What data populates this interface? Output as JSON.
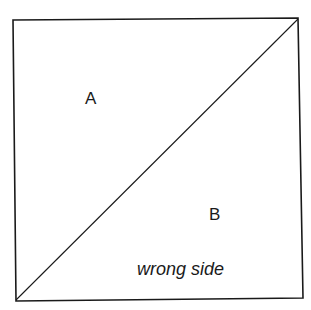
{
  "diagram": {
    "labels": {
      "a": "A",
      "b": "B",
      "note": "wrong side"
    },
    "colors": {
      "stroke": "#1a1a1a",
      "background": "#ffffff"
    }
  }
}
